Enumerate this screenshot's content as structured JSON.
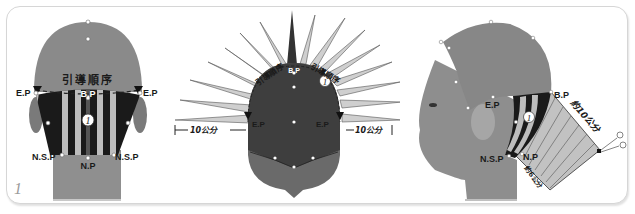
{
  "figure": {
    "number": "1",
    "colors": {
      "head": "#8a8a8a",
      "head_dark": "#3c3c3c",
      "stripe_dark": "#1a1a1a",
      "stripe_light": "#bdbdbd",
      "section_fill": "#c8c8c8",
      "label_dark": "#1a1a1a",
      "label_light": "#ffffff"
    }
  },
  "back_view": {
    "order_label": "引導順序",
    "labels": {
      "ep_left": "E.P",
      "ep_right": "E.P",
      "bp": "B.P",
      "nsp_left": "N.S.P",
      "nsp_right": "N.S.P",
      "np": "N.P"
    },
    "guide_number": "1"
  },
  "top_view": {
    "order_label_left": "引導順序",
    "order_label_right": "引導順序",
    "labels": {
      "bp": "B.P",
      "ep_left": "E.P",
      "ep_right": "E.P"
    },
    "measure_left": "10公分",
    "measure_right": "10公分",
    "guide_number": "1"
  },
  "side_view": {
    "labels": {
      "ep": "E.P",
      "bp": "B.P",
      "nsp": "N.S.P",
      "np": "N.P"
    },
    "length_top": "約10公分",
    "length_bottom": "約6公分",
    "guide_number": "1",
    "tool_icon": "scissors"
  }
}
